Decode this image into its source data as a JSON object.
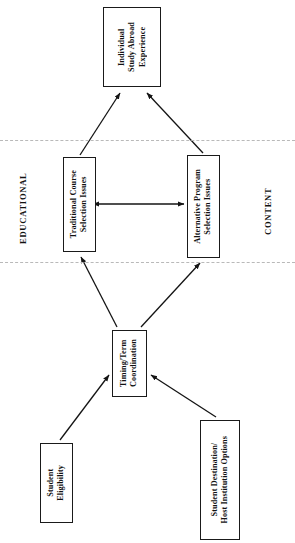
{
  "diagram": {
    "orientation": "rotated-90-ccw",
    "background_color": "#ffffff",
    "line_color": "#1a1a1a",
    "divider_color": "#b9b9b9",
    "zone_labels": [
      {
        "id": "educational",
        "text": "EDUCATIONAL"
      },
      {
        "id": "content",
        "text": "CONTENT"
      }
    ],
    "nodes": [
      {
        "id": "individual-study-abroad-experience",
        "text": "Individual\nStudy Abroad\nExperience",
        "x": 103,
        "y": 7,
        "w": 58,
        "h": 80
      },
      {
        "id": "traditional-course-selection-issues",
        "text": "Traditional Course\nSelection Issues",
        "x": 63,
        "y": 157,
        "w": 33,
        "h": 95
      },
      {
        "id": "alternative-program-selection-issues",
        "text": "Alternative Program\nSelection Issues",
        "x": 187,
        "y": 155,
        "w": 33,
        "h": 103
      },
      {
        "id": "timing-term-coordination",
        "text": "Timing/Term\nCoordination",
        "x": 112,
        "y": 330,
        "w": 35,
        "h": 67
      },
      {
        "id": "student-eligibility",
        "text": "Student\nEligibility",
        "x": 40,
        "y": 443,
        "w": 33,
        "h": 80
      },
      {
        "id": "student-destination-host-institution-options",
        "text": "Student Destination/\nHost Institution Options",
        "x": 200,
        "y": 420,
        "w": 40,
        "h": 120
      }
    ],
    "dividers": [
      {
        "id": "upper-divider",
        "y": 140
      },
      {
        "id": "lower-divider",
        "y": 262
      }
    ],
    "edges": [
      {
        "id": "traditional-to-experience",
        "from": "traditional-course-selection-issues",
        "to": "individual-study-abroad-experience",
        "style": "arrow"
      },
      {
        "id": "alternative-to-experience",
        "from": "alternative-program-selection-issues",
        "to": "individual-study-abroad-experience",
        "style": "arrow"
      },
      {
        "id": "traditional-alternative-bidirectional",
        "from": "traditional-course-selection-issues",
        "to": "alternative-program-selection-issues",
        "style": "double-arrow"
      },
      {
        "id": "timing-to-traditional",
        "from": "timing-term-coordination",
        "to": "traditional-course-selection-issues",
        "style": "arrow"
      },
      {
        "id": "timing-to-alternative",
        "from": "timing-term-coordination",
        "to": "alternative-program-selection-issues",
        "style": "arrow"
      },
      {
        "id": "eligibility-to-timing",
        "from": "student-eligibility",
        "to": "timing-term-coordination",
        "style": "arrow"
      },
      {
        "id": "destination-to-timing",
        "from": "student-destination-host-institution-options",
        "to": "timing-term-coordination",
        "style": "arrow"
      }
    ]
  }
}
